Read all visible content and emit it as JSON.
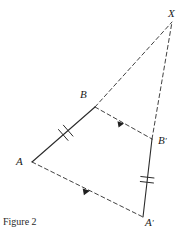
{
  "figure": {
    "caption": "Figure 2",
    "stroke_color": "#2b2b2b",
    "background_color": "#ffffff",
    "labels": {
      "x": "X",
      "b": "B",
      "b_prime_base": "B",
      "b_prime_mark": "′",
      "a": "A",
      "a_prime_base": "A",
      "a_prime_mark": "′"
    },
    "points": {
      "X": {
        "x": 172,
        "y": 22
      },
      "B": {
        "x": 95,
        "y": 107
      },
      "Bp": {
        "x": 152,
        "y": 139
      },
      "A": {
        "x": 32,
        "y": 162
      },
      "Ap": {
        "x": 143,
        "y": 217
      }
    },
    "segments": [
      {
        "name": "AB",
        "style": "solid",
        "ticks": 2,
        "arrow": false
      },
      {
        "name": "BpAp",
        "style": "solid",
        "ticks": 2,
        "arrow": false
      },
      {
        "name": "BX",
        "style": "dashed",
        "ticks": 0,
        "arrow": false
      },
      {
        "name": "BpX",
        "style": "dashed",
        "ticks": 0,
        "arrow": false
      },
      {
        "name": "BBp",
        "style": "dashed",
        "ticks": 0,
        "arrow": true
      },
      {
        "name": "AAp",
        "style": "dashed",
        "ticks": 0,
        "arrow": true
      }
    ]
  }
}
